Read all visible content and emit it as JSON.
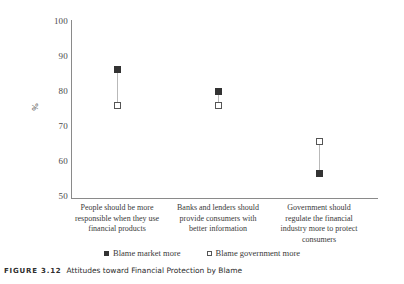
{
  "chart_data": {
    "type": "scatter",
    "title": "",
    "xlabel": "",
    "ylabel": "%",
    "ylim": [
      50,
      100
    ],
    "yticks": [
      50,
      60,
      70,
      80,
      90,
      100
    ],
    "grid": false,
    "legend_position": "bottom",
    "categories": [
      "People should be more responsible when they use financial products",
      "Banks and lenders should provide consumers with better information",
      "Government should regulate the financial industry more to protect consumers"
    ],
    "series": [
      {
        "name": "Blame market more",
        "marker": "filled-square",
        "values": [
          86,
          80,
          57
        ]
      },
      {
        "name": "Blame government more",
        "marker": "open-square",
        "values": [
          76,
          76,
          66
        ]
      }
    ]
  },
  "axis": {
    "y_label": "%",
    "y_ticks": [
      "100",
      "90",
      "80",
      "70",
      "60",
      "50"
    ]
  },
  "categories": [
    {
      "line1": "People should be more",
      "line2": "responsible when they use",
      "line3": "financial products",
      "line4": ""
    },
    {
      "line1": "Banks and lenders should",
      "line2": "provide consumers with",
      "line3": "better information",
      "line4": ""
    },
    {
      "line1": "Government should",
      "line2": "regulate the financial",
      "line3": "industry more to protect",
      "line4": "consumers"
    }
  ],
  "legend": {
    "items": [
      {
        "label": "Blame market more"
      },
      {
        "label": "Blame government more"
      }
    ]
  },
  "caption": {
    "figure_number": "FIGURE 3.12",
    "text": "Attitudes toward Financial Protection by Blame"
  },
  "colors": {
    "marker_filled": "#333333",
    "marker_open_border": "#555555",
    "connector": "#b9b9b9",
    "axis": "#8a8a8a",
    "text": "#3a3a3a"
  }
}
